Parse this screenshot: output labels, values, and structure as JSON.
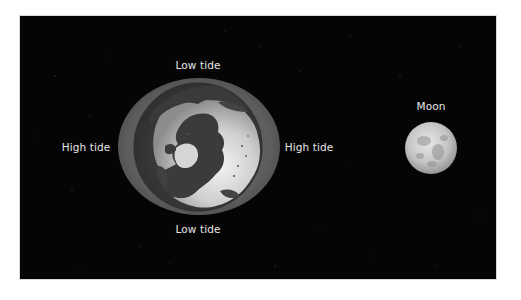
{
  "diagram": {
    "type": "tidal-bulge-illustration",
    "background_color": "#050505",
    "bulge_color": "#5c5c5c",
    "labels": {
      "top": "Low tide",
      "bottom": "Low tide",
      "left": "High tide",
      "right": "High tide",
      "moon": "Moon"
    },
    "objects": {
      "earth": "earth-north-polar-view",
      "tidal_bulge": "water-bulge-ellipse",
      "moon": "moon"
    }
  }
}
